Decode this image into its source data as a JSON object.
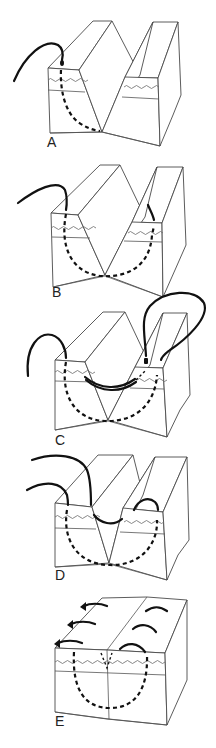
{
  "figure": {
    "panels": [
      {
        "label": "A",
        "description": "V-shaped wedge defect; needle enters at left block surface and passes down along the left wall of the wedge"
      },
      {
        "label": "B",
        "description": "Suture passes under the base of the wedge and exits on the right block surface"
      },
      {
        "label": "C",
        "description": "Suture re-enters right block and crosses back over the wedge superficially"
      },
      {
        "label": "D",
        "description": "Suture loop completed across the wedge before tying"
      },
      {
        "label": "E",
        "description": "Wedge closed; tissue edges approximated with arrows showing direction of closure"
      }
    ],
    "colors": {
      "line": "#4a4a4a",
      "suture": "#111111",
      "background": "#ffffff"
    }
  }
}
